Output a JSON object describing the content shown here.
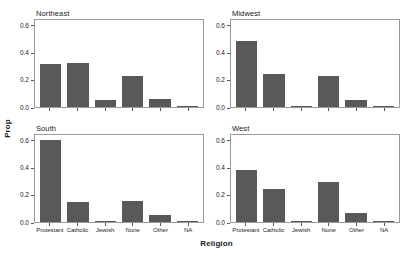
{
  "chart_data": {
    "type": "bar",
    "title": "",
    "xlabel": "Religion",
    "ylabel": "Prop",
    "ylim": [
      0,
      0.65
    ],
    "yticks": [
      "0.0",
      "0.2",
      "0.4",
      "0.6"
    ],
    "ytick_values": [
      0.0,
      0.2,
      0.4,
      0.6
    ],
    "grid": false,
    "legend": "none",
    "bar_color": "#595959",
    "panel_border_color": "#9a9a9a",
    "categories": [
      "Protestant",
      "Catholic",
      "Jewish",
      "None",
      "Other",
      "NA"
    ],
    "panels": [
      {
        "label": "Northeast",
        "values": [
          0.32,
          0.33,
          0.05,
          0.23,
          0.06,
          0.005
        ]
      },
      {
        "label": "Midwest",
        "values": [
          0.49,
          0.25,
          0.005,
          0.23,
          0.05,
          0.008
        ]
      },
      {
        "label": "South",
        "values": [
          0.61,
          0.15,
          0.006,
          0.16,
          0.05,
          0.005
        ]
      },
      {
        "label": "West",
        "values": [
          0.39,
          0.25,
          0.008,
          0.3,
          0.07,
          0.004
        ]
      }
    ]
  }
}
